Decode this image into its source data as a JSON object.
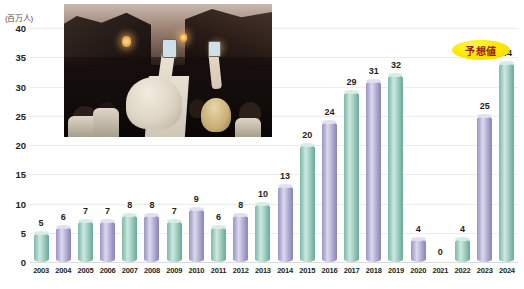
{
  "chart_data": {
    "type": "bar",
    "title": "",
    "xlabel": "",
    "ylabel": "(百万人)",
    "ylim": [
      0,
      40
    ],
    "yticks": [
      0,
      5,
      10,
      15,
      20,
      25,
      30,
      35,
      40
    ],
    "grid": true,
    "legend_position": "none",
    "categories": [
      "2003",
      "2004",
      "2005",
      "2006",
      "2007",
      "2008",
      "2009",
      "2010",
      "2011",
      "2012",
      "2013",
      "2014",
      "2015",
      "2016",
      "2017",
      "2018",
      "2019",
      "2020",
      "2021",
      "2022",
      "2023",
      "2024"
    ],
    "values": [
      5,
      6,
      7,
      7,
      8,
      8,
      7,
      9,
      6,
      8,
      10,
      13,
      20,
      24,
      29,
      31,
      32,
      4,
      0,
      4,
      25,
      34
    ],
    "bar_colors": [
      "teal",
      "purple",
      "teal",
      "purple",
      "teal",
      "purple",
      "teal",
      "purple",
      "teal",
      "purple",
      "teal",
      "purple",
      "teal",
      "purple",
      "teal",
      "purple",
      "teal",
      "purple",
      "teal",
      "teal",
      "purple",
      "teal"
    ],
    "annotations": [
      {
        "text": "予想値",
        "target_category": "2024"
      }
    ]
  },
  "axis": {
    "unit_label": "(百万人)"
  },
  "badge": {
    "label": "予想値",
    "fill_color": "#ffe800",
    "text_color": "#9b1b12"
  },
  "colors": {
    "teal": "#8fc4b4",
    "purple": "#a9a6cc",
    "grid": "#e9edf0",
    "text": "#231f20",
    "background": "#ffffff"
  },
  "photo": {
    "alt": "夜の町並みでスマートフォンを掲げて撮影する観光客"
  }
}
